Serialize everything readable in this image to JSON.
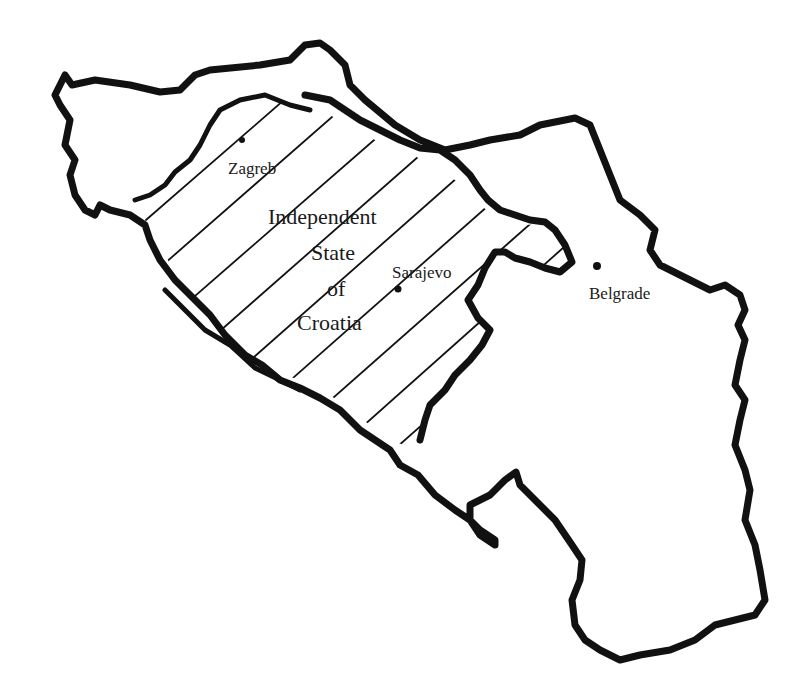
{
  "map": {
    "title": "Independent State of Croatia",
    "region_label_lines": [
      "Independent",
      "State",
      "of",
      "Croatia"
    ],
    "region_style": "diagonal-hatch",
    "colors": {
      "background": "#ffffff",
      "outline": "#111111",
      "hatch": "#111111",
      "text": "#1a1a1a"
    },
    "cities": [
      {
        "name": "Zagreb",
        "x": 240,
        "y": 140
      },
      {
        "name": "Sarajevo",
        "x": 398,
        "y": 289
      },
      {
        "name": "Belgrade",
        "x": 596,
        "y": 266
      }
    ]
  }
}
